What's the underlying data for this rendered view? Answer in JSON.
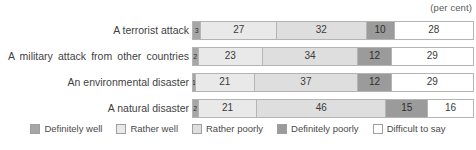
{
  "unit_note": "(per cent)",
  "chart_data": {
    "type": "bar",
    "orientation": "horizontal",
    "stacked": true,
    "normalized_percent": true,
    "title": "",
    "subtitle": "",
    "xlabel": "",
    "ylabel": "",
    "xlim": [
      0,
      100
    ],
    "grid": false,
    "legend_position": "bottom",
    "unit": "(per cent)",
    "categories": [
      "A terrorist attack",
      "A military attack from other countries",
      "An environmental disaster",
      "A natural disaster"
    ],
    "series": [
      {
        "name": "Definitely well",
        "color": "#a6a6a6",
        "values": [
          3,
          2,
          1,
          2
        ]
      },
      {
        "name": "Rather well",
        "color": "#e9e9e9",
        "values": [
          27,
          23,
          21,
          21
        ]
      },
      {
        "name": "Rather poorly",
        "color": "#dedede",
        "values": [
          32,
          34,
          37,
          46
        ]
      },
      {
        "name": "Definitely poorly",
        "color": "#9b9b9b",
        "values": [
          10,
          12,
          12,
          15
        ]
      },
      {
        "name": "Difficult to say",
        "color": "#ffffff",
        "values": [
          28,
          29,
          29,
          16
        ]
      }
    ]
  },
  "legend": {
    "items": [
      {
        "label": "Definitely well",
        "color": "#a6a6a6"
      },
      {
        "label": "Rather well",
        "color": "#e9e9e9"
      },
      {
        "label": "Rather poorly",
        "color": "#dedede"
      },
      {
        "label": "Definitely poorly",
        "color": "#9b9b9b"
      },
      {
        "label": "Difficult to say",
        "color": "#ffffff"
      }
    ]
  }
}
